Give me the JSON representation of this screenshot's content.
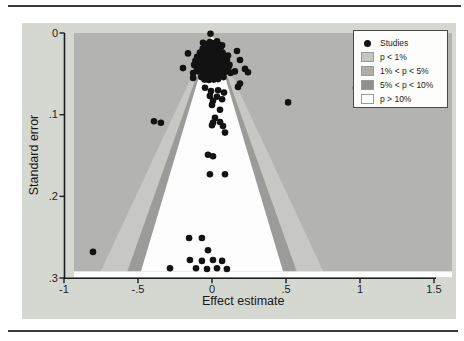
{
  "figure": {
    "kind": "contour-enhanced funnel plot"
  },
  "chart_data": {
    "type": "scatter",
    "title": "",
    "xlabel": "Effect estimate",
    "ylabel": "Standard error",
    "xlim": [
      -1,
      1.5
    ],
    "se_lim": [
      0,
      0.3
    ],
    "x_ticks": [
      "-1",
      "-.5",
      "0",
      ".5",
      "1",
      "1.5"
    ],
    "x_tick_values": [
      -1,
      -0.5,
      0,
      0.5,
      1,
      1.5
    ],
    "y_ticks": [
      "0",
      ".1",
      ".2",
      ".3"
    ],
    "y_tick_values": [
      0,
      0.1,
      0.2,
      0.3
    ],
    "grid": "off",
    "legend_position": "top-right",
    "contours": {
      "apex_effect": 0,
      "se_max_shaded": 0.292,
      "z_10pct": 1.645,
      "z_5pct": 1.96,
      "z_1pct": 2.576
    },
    "studies": [
      [
        -0.01,
        0.001
      ],
      [
        -0.061,
        0.012
      ],
      [
        -0.014,
        0.011
      ],
      [
        0.034,
        0.01
      ],
      [
        0.068,
        0.015
      ],
      [
        -0.162,
        0.025
      ],
      [
        0.169,
        0.022
      ],
      [
        0.189,
        0.033
      ],
      [
        0.223,
        0.044
      ],
      [
        0.243,
        0.048
      ],
      [
        0.189,
        0.062
      ],
      [
        -0.196,
        0.043
      ],
      [
        -0.128,
        0.055
      ],
      [
        0.176,
        0.066
      ],
      [
        0.014,
        0.055
      ],
      [
        0.514,
        0.085
      ],
      [
        0.973,
        0.067
      ],
      [
        -0.804,
        0.268
      ],
      [
        -0.392,
        0.108
      ],
      [
        -0.345,
        0.11
      ],
      [
        0.155,
        0.047
      ],
      [
        -0.047,
        0.067
      ],
      [
        -0.007,
        0.071
      ],
      [
        0.041,
        0.07
      ],
      [
        0.081,
        0.073
      ],
      [
        -0.014,
        0.077
      ],
      [
        0.034,
        0.078
      ],
      [
        0.068,
        0.081
      ],
      [
        0.007,
        0.083
      ],
      [
        0.0,
        0.088
      ],
      [
        0.054,
        0.094
      ],
      [
        0.02,
        0.104
      ],
      [
        0.007,
        0.11
      ],
      [
        0.054,
        0.109
      ],
      [
        0.0,
        0.113
      ],
      [
        0.074,
        0.114
      ],
      [
        0.088,
        0.122
      ],
      [
        -0.027,
        0.149
      ],
      [
        0.007,
        0.151
      ],
      [
        -0.014,
        0.173
      ],
      [
        0.088,
        0.173
      ],
      [
        -0.155,
        0.251
      ],
      [
        -0.068,
        0.251
      ],
      [
        -0.027,
        0.266
      ],
      [
        -0.149,
        0.278
      ],
      [
        -0.068,
        0.279
      ],
      [
        0.007,
        0.278
      ],
      [
        0.068,
        0.279
      ],
      [
        -0.284,
        0.288
      ],
      [
        -0.108,
        0.288
      ],
      [
        -0.034,
        0.289
      ],
      [
        0.034,
        0.288
      ],
      [
        0.101,
        0.289
      ],
      [
        -0.022,
        0.013
      ],
      [
        0.008,
        0.0125
      ],
      [
        0.041,
        0.014
      ],
      [
        -0.062,
        0.019
      ],
      [
        -0.031,
        0.0175
      ],
      [
        0.001,
        0.018
      ],
      [
        0.032,
        0.0185
      ],
      [
        0.061,
        0.017
      ],
      [
        -0.082,
        0.024
      ],
      [
        -0.052,
        0.022
      ],
      [
        -0.021,
        0.023
      ],
      [
        0.012,
        0.0235
      ],
      [
        0.042,
        0.022
      ],
      [
        0.071,
        0.024
      ],
      [
        -0.101,
        0.029
      ],
      [
        -0.072,
        0.027
      ],
      [
        -0.041,
        0.028
      ],
      [
        -0.012,
        0.0285
      ],
      [
        0.021,
        0.027
      ],
      [
        0.052,
        0.029
      ],
      [
        0.082,
        0.028
      ],
      [
        0.108,
        0.0275
      ],
      [
        -0.112,
        0.034
      ],
      [
        -0.081,
        0.032
      ],
      [
        -0.052,
        0.033
      ],
      [
        -0.022,
        0.0335
      ],
      [
        0.011,
        0.032
      ],
      [
        0.042,
        0.034
      ],
      [
        0.072,
        0.033
      ],
      [
        0.101,
        0.0325
      ],
      [
        -0.121,
        0.039
      ],
      [
        -0.092,
        0.037
      ],
      [
        -0.061,
        0.038
      ],
      [
        -0.032,
        0.0385
      ],
      [
        0.002,
        0.037
      ],
      [
        0.031,
        0.039
      ],
      [
        0.062,
        0.038
      ],
      [
        0.092,
        0.0375
      ],
      [
        0.118,
        0.039
      ],
      [
        -0.102,
        0.044
      ],
      [
        -0.071,
        0.042
      ],
      [
        -0.042,
        0.043
      ],
      [
        -0.011,
        0.0435
      ],
      [
        0.022,
        0.042
      ],
      [
        0.051,
        0.044
      ],
      [
        0.081,
        0.043
      ],
      [
        0.111,
        0.0425
      ],
      [
        -0.128,
        0.049
      ],
      [
        -0.091,
        0.047
      ],
      [
        -0.062,
        0.048
      ],
      [
        -0.031,
        0.0485
      ],
      [
        0.001,
        0.047
      ],
      [
        0.032,
        0.049
      ],
      [
        0.061,
        0.048
      ],
      [
        0.091,
        0.0475
      ],
      [
        0.126,
        0.049
      ],
      [
        -0.072,
        0.054
      ],
      [
        -0.041,
        0.052
      ],
      [
        -0.012,
        0.053
      ],
      [
        0.021,
        0.0535
      ],
      [
        0.052,
        0.052
      ],
      [
        0.078,
        0.054
      ],
      [
        -0.051,
        0.057
      ],
      [
        -0.021,
        0.0575
      ],
      [
        0.012,
        0.057
      ],
      [
        0.041,
        0.0565
      ]
    ]
  },
  "legend": {
    "items": [
      {
        "label": "Studies",
        "marker": "dot",
        "color": "#121212"
      },
      {
        "label": "p < 1%",
        "marker": "swatch",
        "color": "#c6c7c3"
      },
      {
        "label": "1% < p < 5%",
        "marker": "swatch",
        "color": "#adaeaa"
      },
      {
        "label": "5% < p < 10%",
        "marker": "swatch",
        "color": "#90918e"
      },
      {
        "label": "p > 10%",
        "marker": "swatch",
        "color": "#ffffff"
      }
    ]
  },
  "colors": {
    "figure_bg": "#d5d7d1",
    "plot_bg": "#b3b4b1",
    "band_1_5": "#c7c8c4",
    "band_5_10": "#9b9c99",
    "center_region": "#fdfdfd",
    "dot": "#121212",
    "axis": "#1c1c1c",
    "rule": "#3a3a3a"
  }
}
